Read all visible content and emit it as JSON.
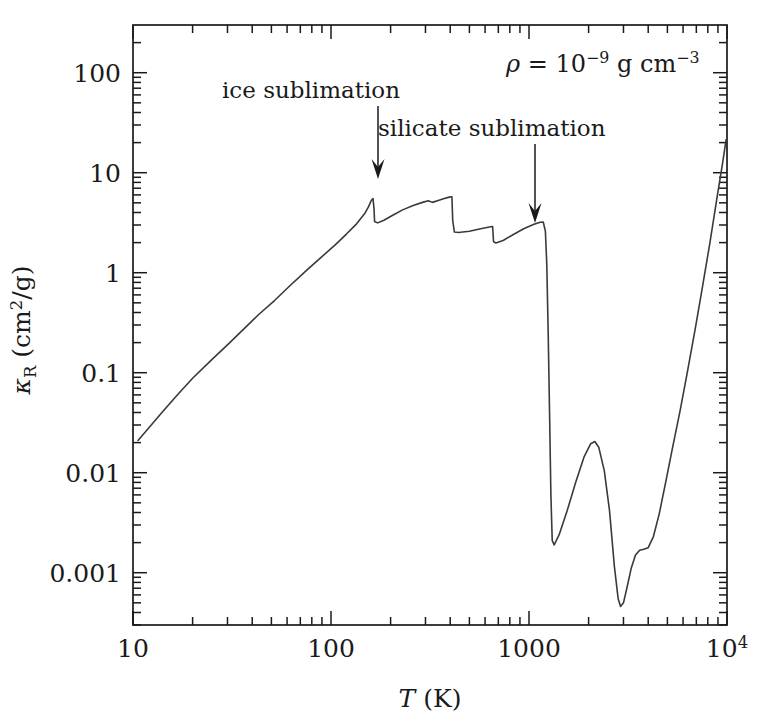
{
  "chart_data": {
    "type": "line",
    "title": "",
    "xlabel": "T (K)",
    "ylabel": "κ_R (cm²/g)",
    "xscale": "log",
    "yscale": "log",
    "xlim": [
      10,
      10000
    ],
    "ylim": [
      0.0003,
      300
    ],
    "grid": false,
    "legend": "none",
    "xticks": [
      "10",
      "100",
      "1000",
      "10"
    ],
    "xtick_values": [
      10,
      100,
      1000,
      10000
    ],
    "xtick_last_exponent": "4",
    "yticks": [
      "100",
      "10",
      "1",
      "0.1",
      "0.01",
      "0.001"
    ],
    "ytick_values": [
      100,
      10,
      1,
      0.1,
      0.01,
      0.001
    ],
    "series": [
      {
        "name": "Rosseland mean opacity",
        "points": [
          [
            10.6,
            0.021
          ],
          [
            12.0,
            0.028
          ],
          [
            14.0,
            0.04
          ],
          [
            17.0,
            0.062
          ],
          [
            20.0,
            0.088
          ],
          [
            25.0,
            0.135
          ],
          [
            30.0,
            0.19
          ],
          [
            36.0,
            0.27
          ],
          [
            43.0,
            0.38
          ],
          [
            52.0,
            0.53
          ],
          [
            62.0,
            0.74
          ],
          [
            75.0,
            1.05
          ],
          [
            90.0,
            1.45
          ],
          [
            105.0,
            1.9
          ],
          [
            120.0,
            2.45
          ],
          [
            135.0,
            3.1
          ],
          [
            148.0,
            3.9
          ],
          [
            155.0,
            4.6
          ],
          [
            160.0,
            5.3
          ],
          [
            163.0,
            5.5
          ],
          [
            165.0,
            4.3
          ],
          [
            166.0,
            3.25
          ],
          [
            172.0,
            3.15
          ],
          [
            185.0,
            3.35
          ],
          [
            205.0,
            3.75
          ],
          [
            230.0,
            4.25
          ],
          [
            260.0,
            4.7
          ],
          [
            290.0,
            5.05
          ],
          [
            310.0,
            5.25
          ],
          [
            325.0,
            5.05
          ],
          [
            345.0,
            5.25
          ],
          [
            370.0,
            5.5
          ],
          [
            395.0,
            5.7
          ],
          [
            408.0,
            5.75
          ],
          [
            412.0,
            3.3
          ],
          [
            420.0,
            2.55
          ],
          [
            440.0,
            2.52
          ],
          [
            500.0,
            2.6
          ],
          [
            570.0,
            2.75
          ],
          [
            640.0,
            2.88
          ],
          [
            655.0,
            2.9
          ],
          [
            662.0,
            2.05
          ],
          [
            680.0,
            1.98
          ],
          [
            740.0,
            2.1
          ],
          [
            830.0,
            2.4
          ],
          [
            940.0,
            2.75
          ],
          [
            1060.0,
            3.05
          ],
          [
            1140.0,
            3.2
          ],
          [
            1180.0,
            3.22
          ],
          [
            1210.0,
            2.6
          ],
          [
            1230.0,
            1.2
          ],
          [
            1250.0,
            0.25
          ],
          [
            1270.0,
            0.04
          ],
          [
            1290.0,
            0.006
          ],
          [
            1310.0,
            0.0021
          ],
          [
            1340.0,
            0.0019
          ],
          [
            1420.0,
            0.0024
          ],
          [
            1560.0,
            0.0042
          ],
          [
            1720.0,
            0.008
          ],
          [
            1900.0,
            0.0145
          ],
          [
            2050.0,
            0.0195
          ],
          [
            2150.0,
            0.0205
          ],
          [
            2250.0,
            0.018
          ],
          [
            2400.0,
            0.0105
          ],
          [
            2550.0,
            0.0042
          ],
          [
            2700.0,
            0.00115
          ],
          [
            2820.0,
            0.00055
          ],
          [
            2900.0,
            0.00046
          ],
          [
            3000.0,
            0.0005
          ],
          [
            3120.0,
            0.0007
          ],
          [
            3280.0,
            0.0011
          ],
          [
            3450.0,
            0.0015
          ],
          [
            3620.0,
            0.00168
          ],
          [
            3800.0,
            0.00172
          ],
          [
            4000.0,
            0.00178
          ],
          [
            4250.0,
            0.0023
          ],
          [
            4550.0,
            0.0039
          ],
          [
            4900.0,
            0.008
          ],
          [
            5300.0,
            0.0175
          ],
          [
            5800.0,
            0.042
          ],
          [
            6300.0,
            0.1
          ],
          [
            6900.0,
            0.27
          ],
          [
            7500.0,
            0.7
          ],
          [
            8200.0,
            2.0
          ],
          [
            8900.0,
            5.6
          ],
          [
            9500.0,
            12.5
          ],
          [
            9900.0,
            21.5
          ]
        ]
      }
    ],
    "annotations": [
      {
        "id": "ice-sublimation",
        "text": "ice sublimation",
        "label_x": 222,
        "label_y": 98,
        "arrow_x": 378,
        "arrow_y_start": 106,
        "arrow_y_end": 179
      },
      {
        "id": "silicate-sublimation",
        "text": "silicate sublimation",
        "label_x": 378,
        "label_y": 136,
        "arrow_x": 535,
        "arrow_y_start": 144,
        "arrow_y_end": 223
      }
    ],
    "density_label": {
      "rho_symbol": "ρ",
      "equals": "=",
      "base": "10",
      "exponent": "−9",
      "units_mass": "g",
      "units_length": "cm",
      "units_length_exponent": "−3",
      "full_text": "ρ = 10⁻⁹ g cm⁻³",
      "x": 506,
      "y": 72
    }
  },
  "figure": {
    "background_color": "#ffffff",
    "line_color": "#3a3a3a",
    "axis_color": "#1a1a1a",
    "plot_box": {
      "left": 133,
      "top": 25,
      "right": 727,
      "bottom": 625
    }
  },
  "axes": {
    "x": {
      "title_italic": "T",
      "title_units": "(K)",
      "labels": [
        {
          "text": "10",
          "value": 10
        },
        {
          "text": "100",
          "value": 100
        },
        {
          "text": "1000",
          "value": 1000
        },
        {
          "text": "10",
          "sup": "4",
          "value": 10000
        }
      ]
    },
    "y": {
      "title_symbol": "κ",
      "title_subscript": "R",
      "title_units": "(cm",
      "title_units_sup": "2",
      "title_units_tail": "/g)",
      "labels": [
        {
          "text": "100",
          "value": 100
        },
        {
          "text": "10",
          "value": 10
        },
        {
          "text": "1",
          "value": 1
        },
        {
          "text": "0.1",
          "value": 0.1
        },
        {
          "text": "0.01",
          "value": 0.01
        },
        {
          "text": "0.001",
          "value": 0.001
        }
      ]
    }
  }
}
